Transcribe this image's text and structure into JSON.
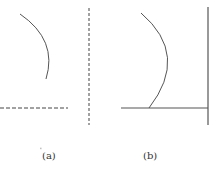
{
  "figure": {
    "panels": [
      {
        "id": "a",
        "label": "(a)",
        "mark": "'",
        "curve": {
          "start": [
            20,
            14
          ],
          "control": [
            58,
            40
          ],
          "end": [
            46,
            79
          ]
        },
        "dashed_horizontal": {
          "x1": 0,
          "x2": 68,
          "y": 108
        },
        "dashed_vertical": {
          "x": 89,
          "y1": 8,
          "y2": 125
        }
      },
      {
        "id": "b",
        "label": "(b)",
        "curve": {
          "start": [
            141,
            13
          ],
          "control": [
            190,
            55
          ],
          "end": [
            149,
            108
          ]
        },
        "solid_horizontal": {
          "x1": 121,
          "x2": 208,
          "y": 108
        },
        "solid_vertical": {
          "x": 208,
          "y1": 7,
          "y2": 125
        }
      }
    ],
    "colors": {
      "line": "#555555",
      "background": "#ffffff"
    }
  }
}
